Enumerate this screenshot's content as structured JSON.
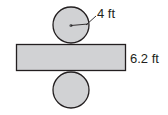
{
  "diagram": {
    "type": "cylinder-net",
    "shapes": {
      "top_circle": {
        "cx": 71,
        "cy": 25,
        "r": 18
      },
      "rectangle": {
        "x": 16,
        "y": 44,
        "width": 110,
        "height": 27
      },
      "bottom_circle": {
        "cx": 71,
        "cy": 90,
        "r": 18
      }
    },
    "labels": {
      "radius": "4 ft",
      "height": "6.2 ft"
    },
    "colors": {
      "fill": "#d1d2d4",
      "stroke": "#231f20",
      "text": "#231f20"
    }
  }
}
